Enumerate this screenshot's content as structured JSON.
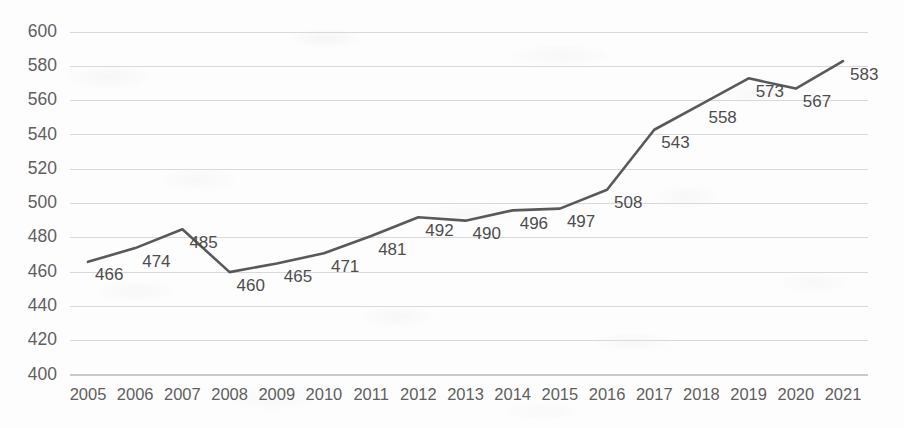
{
  "chart_data": {
    "type": "line",
    "title": "",
    "subtitle": "",
    "xlabel": "",
    "ylabel": "",
    "categories": [
      "2005",
      "2006",
      "2007",
      "2008",
      "2009",
      "2010",
      "2011",
      "2012",
      "2013",
      "2014",
      "2015",
      "2016",
      "2017",
      "2018",
      "2019",
      "2020",
      "2021"
    ],
    "values": [
      466,
      474,
      485,
      460,
      465,
      471,
      481,
      492,
      490,
      496,
      497,
      508,
      543,
      558,
      573,
      567,
      583
    ],
    "point_labels": [
      "466",
      "474",
      "485",
      "460",
      "465",
      "471",
      "481",
      "492",
      "490",
      "496",
      "497",
      "508",
      "543",
      "558",
      "573",
      "567",
      "583"
    ],
    "ylim": [
      400,
      600
    ],
    "yticks": [
      400,
      420,
      440,
      460,
      480,
      500,
      520,
      540,
      560,
      580,
      600
    ],
    "ytick_labels": [
      "400",
      "420",
      "440",
      "460",
      "480",
      "500",
      "520",
      "540",
      "560",
      "580",
      "600"
    ],
    "grid": true,
    "grid_axis": "y",
    "legend": false,
    "legend_position": "none",
    "series": [
      {
        "name": "series-1",
        "values": [
          466,
          474,
          485,
          460,
          465,
          471,
          481,
          492,
          490,
          496,
          497,
          508,
          543,
          558,
          573,
          567,
          583
        ]
      }
    ],
    "colors": {
      "line": "#595959",
      "gridline": "#d9d9d9",
      "axis": "#c9c9c9",
      "tick_text": "#5f5f5f",
      "data_label_text": "#4d4d4d",
      "background": "#fdfdfd"
    },
    "markers": false,
    "data_labels_shown": true,
    "data_label_position": "right-below"
  }
}
